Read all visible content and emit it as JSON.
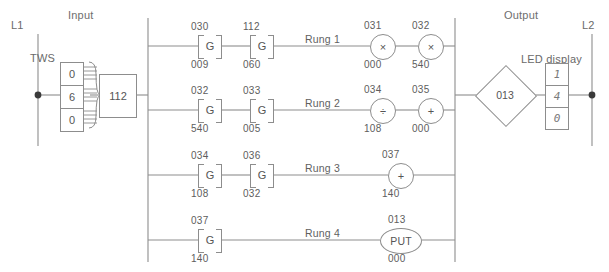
{
  "diagram": {
    "type": "plc-ladder-logic",
    "sections": {
      "input_label": "Input",
      "output_label": "Output",
      "left_rail_label": "L1",
      "right_rail_label": "L2"
    },
    "input_devices": {
      "tws_label": "TWS",
      "tws_digits": [
        "0",
        "6",
        "0"
      ],
      "interface_box": "112"
    },
    "output_devices": {
      "diamond_label": "013",
      "led_label": "LED display",
      "led_digits": [
        "1",
        "4",
        "0"
      ]
    },
    "rungs": [
      {
        "name": "Rung 1",
        "contacts": [
          {
            "top": "030",
            "symbol": "G",
            "bottom": "009"
          },
          {
            "top": "112",
            "symbol": "G",
            "bottom": "060"
          }
        ],
        "outputs": [
          {
            "top": "031",
            "symbol": "×",
            "bottom": "000"
          },
          {
            "top": "032",
            "symbol": "×",
            "bottom": "540"
          }
        ]
      },
      {
        "name": "Rung 2",
        "contacts": [
          {
            "top": "032",
            "symbol": "G",
            "bottom": "540"
          },
          {
            "top": "033",
            "symbol": "G",
            "bottom": "005"
          }
        ],
        "outputs": [
          {
            "top": "034",
            "symbol": "÷",
            "bottom": "108"
          },
          {
            "top": "035",
            "symbol": "+",
            "bottom": "000"
          }
        ]
      },
      {
        "name": "Rung 3",
        "contacts": [
          {
            "top": "034",
            "symbol": "G",
            "bottom": "108"
          },
          {
            "top": "036",
            "symbol": "G",
            "bottom": "032"
          }
        ],
        "outputs": [
          {
            "top": "037",
            "symbol": "+",
            "bottom": "140"
          }
        ]
      },
      {
        "name": "Rung 4",
        "contacts": [
          {
            "top": "037",
            "symbol": "G",
            "bottom": "140"
          }
        ],
        "outputs": [
          {
            "top": "013",
            "symbol": "PUT",
            "bottom": "000"
          }
        ]
      }
    ],
    "colors": {
      "line": "#8d8d8d",
      "text": "#5d5d5d",
      "background": "#ffffff"
    }
  }
}
